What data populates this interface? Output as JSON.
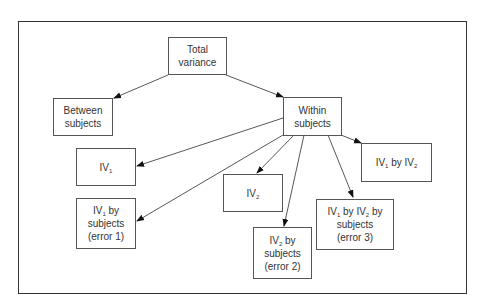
{
  "diagram": {
    "type": "tree",
    "nodes": [
      {
        "id": "total",
        "lines": [
          "Total",
          "variance"
        ]
      },
      {
        "id": "between",
        "lines": [
          "Between",
          "subjects"
        ]
      },
      {
        "id": "within",
        "lines": [
          "Within",
          "subjects"
        ]
      },
      {
        "id": "iv1",
        "text": "IV",
        "sub": "1"
      },
      {
        "id": "iv1_subj",
        "lines": [
          "subjects",
          "(error 1)"
        ],
        "head": "IV",
        "head_sub": "1",
        "head_tail": " by"
      },
      {
        "id": "iv2",
        "text": "IV",
        "sub": "2"
      },
      {
        "id": "iv2_subj",
        "lines": [
          "subjects",
          "(error 2)"
        ],
        "head": "IV",
        "head_sub": "2",
        "head_tail": " by"
      },
      {
        "id": "iv1_iv2_subj",
        "lines": [
          "subjects",
          "(error 3)"
        ],
        "head": "IV",
        "head_sub": "1",
        "head_mid": " by IV",
        "head_sub2": "2",
        "head_tail": " by"
      },
      {
        "id": "iv1_iv2",
        "head": "IV",
        "head_sub": "1",
        "head_mid": " by IV",
        "head_sub2": "2"
      }
    ],
    "edges": [
      {
        "from": "total",
        "to": "between"
      },
      {
        "from": "total",
        "to": "within"
      },
      {
        "from": "within",
        "to": "iv1"
      },
      {
        "from": "within",
        "to": "iv1_subj"
      },
      {
        "from": "within",
        "to": "iv2"
      },
      {
        "from": "within",
        "to": "iv2_subj"
      },
      {
        "from": "within",
        "to": "iv1_iv2_subj"
      },
      {
        "from": "within",
        "to": "iv1_iv2"
      }
    ]
  }
}
